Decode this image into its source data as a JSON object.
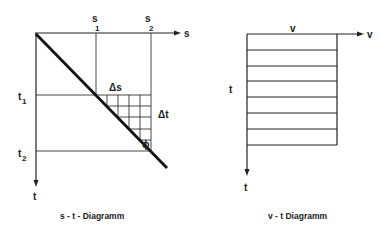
{
  "st_diagram": {
    "caption": "s - t - Diagramm",
    "s_axis_label": "s",
    "t_axis_label": "t",
    "s1_label": "s",
    "s1_sub": "1",
    "s2_label": "s",
    "s2_sub": "2",
    "t1_label": "t",
    "t1_sub": "1",
    "t2_label": "t",
    "t2_sub": "2",
    "delta_s_label": "Δs",
    "delta_t_label": "Δt",
    "angle_label": "ϕ"
  },
  "vt_diagram": {
    "caption": "v - t Diagramm",
    "v_axis_label": "v",
    "t_axis_label": "t",
    "v_level_label": "v",
    "side_t_label": "t",
    "strip_count": 8
  },
  "colors": {
    "line": "#222222",
    "background": "#ffffff"
  }
}
